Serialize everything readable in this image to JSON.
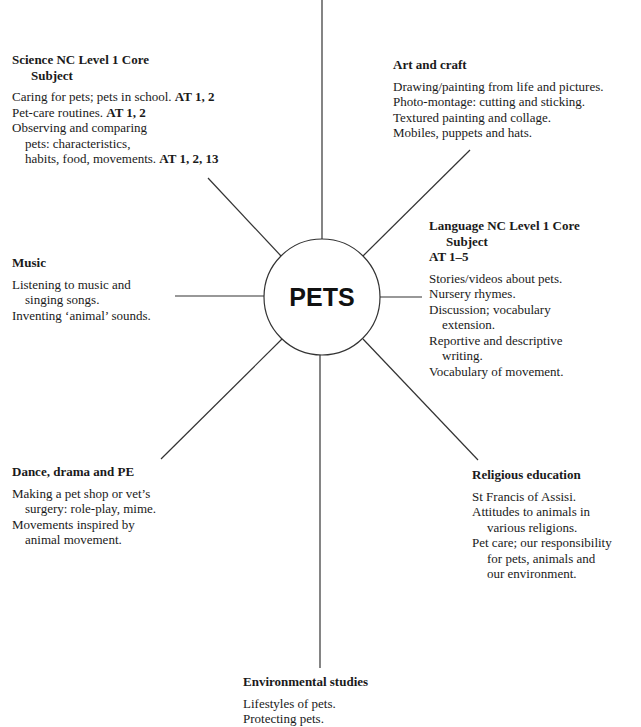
{
  "center": {
    "label": "PETS"
  },
  "branches": {
    "science": {
      "title_line1": "Science NC Level 1 Core",
      "title_line2": "Subject",
      "items": [
        {
          "text": "Caring for pets; pets in school. ",
          "bold": "AT 1, 2",
          "indent": false
        },
        {
          "text": "Pet-care routines. ",
          "bold": "AT 1, 2",
          "indent": false
        },
        {
          "text": "Observing and comparing",
          "bold": "",
          "indent": false
        },
        {
          "text": "pets: characteristics,",
          "bold": "",
          "indent": true
        },
        {
          "text": "habits, food, movements. ",
          "bold": "AT 1, 2, 13",
          "indent": true
        }
      ]
    },
    "art": {
      "title_line1": "Art and craft",
      "items": [
        {
          "text": "Drawing/painting from life and pictures."
        },
        {
          "text": "Photo-montage: cutting and sticking."
        },
        {
          "text": "Textured painting and collage."
        },
        {
          "text": "Mobiles, puppets and hats."
        }
      ]
    },
    "music": {
      "title_line1": "Music",
      "items": [
        {
          "text": "Listening to music and",
          "indent": false
        },
        {
          "text": "singing songs.",
          "indent": true
        },
        {
          "text": "Inventing ‘animal’ sounds.",
          "indent": false
        }
      ]
    },
    "language": {
      "title_line1": "Language NC Level 1 Core",
      "title_line2": "Subject",
      "title_line3": "AT 1–5",
      "items": [
        {
          "text": "Stories/videos about pets.",
          "indent": false
        },
        {
          "text": "Nursery rhymes.",
          "indent": false
        },
        {
          "text": "Discussion; vocabulary",
          "indent": false
        },
        {
          "text": "extension.",
          "indent": true
        },
        {
          "text": "Reportive and descriptive",
          "indent": false
        },
        {
          "text": "writing.",
          "indent": true
        },
        {
          "text": "Vocabulary of movement.",
          "indent": false
        }
      ]
    },
    "dance": {
      "title_line1": "Dance, drama and PE",
      "items": [
        {
          "text": "Making a pet shop or vet’s",
          "indent": false
        },
        {
          "text": "surgery: role-play, mime.",
          "indent": true
        },
        {
          "text": "Movements inspired by",
          "indent": false
        },
        {
          "text": "animal movement.",
          "indent": true
        }
      ]
    },
    "religious": {
      "title_line1": "Religious education",
      "items": [
        {
          "text": "St Francis of Assisi.",
          "indent": false
        },
        {
          "text": "Attitudes to animals in",
          "indent": false
        },
        {
          "text": "various religions.",
          "indent": true
        },
        {
          "text": "Pet care; our responsibility",
          "indent": false
        },
        {
          "text": "for pets, animals and",
          "indent": true
        },
        {
          "text": "our environment.",
          "indent": true
        }
      ]
    },
    "environmental": {
      "title_line1": "Environmental studies",
      "items": [
        {
          "text": "Lifestyles of pets."
        },
        {
          "text": "Protecting pets."
        }
      ]
    }
  },
  "colors": {
    "line": "#333333",
    "text": "#1a1a1a"
  }
}
